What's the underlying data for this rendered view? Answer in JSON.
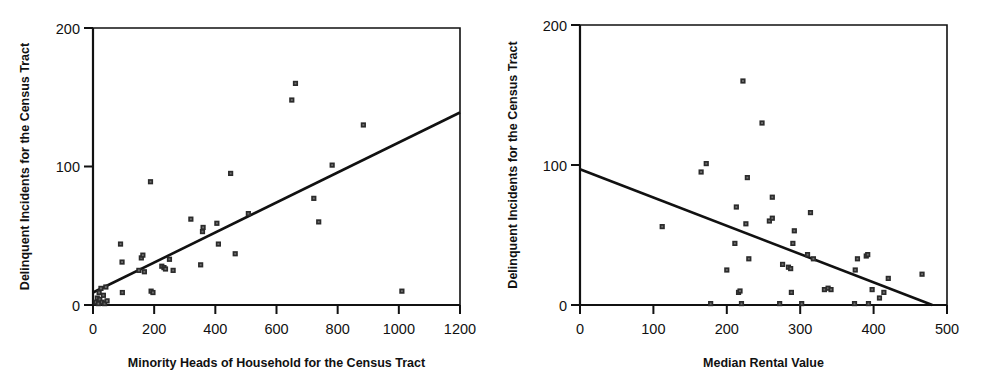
{
  "figure": {
    "background": "#ffffff",
    "ink_color": "#111111",
    "marker_color": "#2b2b2b",
    "panel_count": 2
  },
  "chart_data": [
    {
      "type": "scatter",
      "panel": "left",
      "title": "",
      "xlabel": "Minority Heads of Household for the Census Tract",
      "ylabel": "Delinquent Incidents for the Census Tract",
      "xlim": [
        0,
        1200
      ],
      "ylim": [
        0,
        200
      ],
      "xticks": [
        0,
        200,
        400,
        600,
        800,
        1000,
        1200
      ],
      "yticks": [
        0,
        100,
        200
      ],
      "xtick_labels": [
        "0",
        "200",
        "400",
        "600",
        "800",
        "1000",
        "1200"
      ],
      "ytick_labels": [
        "0",
        "100",
        "200"
      ],
      "grid": false,
      "legend": "none",
      "marker": "square",
      "points": [
        [
          10,
          2
        ],
        [
          14,
          5
        ],
        [
          18,
          1
        ],
        [
          20,
          9
        ],
        [
          22,
          4
        ],
        [
          26,
          12
        ],
        [
          30,
          2
        ],
        [
          34,
          7
        ],
        [
          38,
          1
        ],
        [
          42,
          13
        ],
        [
          46,
          3
        ],
        [
          90,
          44
        ],
        [
          95,
          31
        ],
        [
          96,
          9
        ],
        [
          150,
          25
        ],
        [
          158,
          34
        ],
        [
          163,
          36
        ],
        [
          168,
          24
        ],
        [
          188,
          89
        ],
        [
          190,
          10
        ],
        [
          196,
          9
        ],
        [
          225,
          28
        ],
        [
          232,
          27
        ],
        [
          237,
          26
        ],
        [
          250,
          33
        ],
        [
          262,
          25
        ],
        [
          320,
          62
        ],
        [
          352,
          29
        ],
        [
          358,
          53
        ],
        [
          360,
          56
        ],
        [
          405,
          59
        ],
        [
          410,
          44
        ],
        [
          450,
          95
        ],
        [
          465,
          37
        ],
        [
          508,
          66
        ],
        [
          650,
          148
        ],
        [
          662,
          160
        ],
        [
          722,
          77
        ],
        [
          738,
          60
        ],
        [
          782,
          101
        ],
        [
          884,
          130
        ],
        [
          1010,
          10
        ]
      ],
      "fit_line": {
        "x": [
          0,
          1200
        ],
        "y": [
          9,
          139
        ]
      }
    },
    {
      "type": "scatter",
      "panel": "right",
      "title": "",
      "xlabel": "Median Rental Value",
      "ylabel": "Delinquent Incidents for the Census Tract",
      "xlim": [
        0,
        500
      ],
      "ylim": [
        0,
        200
      ],
      "xticks": [
        0,
        100,
        200,
        300,
        400,
        500
      ],
      "yticks": [
        0,
        100,
        200
      ],
      "xtick_labels": [
        "0",
        "100",
        "200",
        "300",
        "400",
        "500"
      ],
      "ytick_labels": [
        "0",
        "100",
        "200"
      ],
      "grid": false,
      "legend": "none",
      "marker": "square",
      "points": [
        [
          112,
          56
        ],
        [
          165,
          95
        ],
        [
          172,
          101
        ],
        [
          178,
          1
        ],
        [
          200,
          25
        ],
        [
          211,
          44
        ],
        [
          213,
          70
        ],
        [
          216,
          9
        ],
        [
          218,
          10
        ],
        [
          220,
          1
        ],
        [
          222,
          160
        ],
        [
          226,
          58
        ],
        [
          228,
          91
        ],
        [
          230,
          33
        ],
        [
          248,
          130
        ],
        [
          258,
          60
        ],
        [
          262,
          62
        ],
        [
          262,
          77
        ],
        [
          272,
          1
        ],
        [
          276,
          29
        ],
        [
          284,
          27
        ],
        [
          287,
          26
        ],
        [
          288,
          9
        ],
        [
          290,
          44
        ],
        [
          292,
          53
        ],
        [
          302,
          1
        ],
        [
          310,
          36
        ],
        [
          314,
          66
        ],
        [
          318,
          33
        ],
        [
          333,
          11
        ],
        [
          338,
          12
        ],
        [
          342,
          11
        ],
        [
          374,
          1
        ],
        [
          375,
          25
        ],
        [
          378,
          33
        ],
        [
          390,
          35
        ],
        [
          392,
          36
        ],
        [
          393,
          1
        ],
        [
          398,
          11
        ],
        [
          408,
          5
        ],
        [
          414,
          9
        ],
        [
          420,
          19
        ],
        [
          466,
          22
        ]
      ],
      "fit_line": {
        "x": [
          0,
          480
        ],
        "y": [
          97,
          0
        ]
      }
    }
  ]
}
